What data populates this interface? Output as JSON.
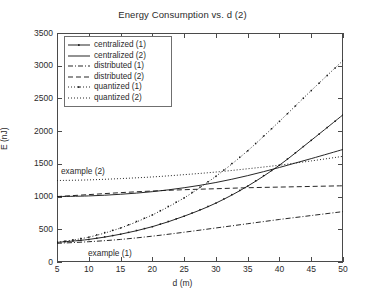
{
  "chart_data": {
    "type": "line",
    "title": "Energy Consumption vs. d (2)",
    "xlabel": "d (m)",
    "ylabel": "E (nJ)",
    "xlim": [
      5,
      50
    ],
    "ylim": [
      0,
      3500
    ],
    "xticks": [
      5,
      10,
      15,
      20,
      25,
      30,
      35,
      40,
      45,
      50
    ],
    "yticks": [
      0,
      500,
      1000,
      1500,
      2000,
      2500,
      3000,
      3500
    ],
    "grid": false,
    "legend_position": "upper-left",
    "x": [
      5,
      10,
      15,
      20,
      25,
      30,
      35,
      40,
      45,
      50
    ],
    "series": [
      {
        "name": "centralized (1)",
        "style": "solid-marker",
        "values": [
          300,
          345,
          425,
          540,
          700,
          900,
          1160,
          1480,
          1860,
          2250
        ]
      },
      {
        "name": "centralized (2)",
        "style": "solid",
        "values": [
          1000,
          1010,
          1035,
          1075,
          1135,
          1215,
          1320,
          1445,
          1580,
          1720
        ]
      },
      {
        "name": "distributed (1)",
        "style": "dash-dot",
        "values": [
          285,
          310,
          345,
          395,
          455,
          520,
          585,
          650,
          710,
          770
        ]
      },
      {
        "name": "distributed (2)",
        "style": "dashed",
        "values": [
          1000,
          1030,
          1060,
          1085,
          1105,
          1120,
          1135,
          1145,
          1155,
          1165
        ]
      },
      {
        "name": "quantized (1)",
        "style": "dotted-marker",
        "values": [
          300,
          380,
          520,
          720,
          980,
          1310,
          1700,
          2150,
          2620,
          3080
        ]
      },
      {
        "name": "quantized (2)",
        "style": "dotted",
        "values": [
          1245,
          1255,
          1275,
          1300,
          1335,
          1375,
          1425,
          1480,
          1545,
          1615
        ]
      }
    ],
    "annotations": [
      {
        "text": "example (2)",
        "x": 11.5,
        "y": 1500
      },
      {
        "text": "example (1)",
        "x": 16.5,
        "y": 240
      }
    ],
    "colors": {
      "axis": "#4a4a4a",
      "line": "#1a1a1a",
      "text": "#2b2b2b",
      "background": "#ffffff"
    }
  },
  "legend": {
    "entries": [
      {
        "label": "centralized (1)"
      },
      {
        "label": "centralized (2)"
      },
      {
        "label": "distributed (1)"
      },
      {
        "label": "distributed (2)"
      },
      {
        "label": "quantized (1)"
      },
      {
        "label": "quantized (2)"
      }
    ]
  },
  "caption": ""
}
